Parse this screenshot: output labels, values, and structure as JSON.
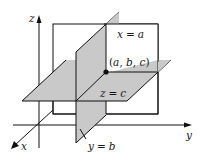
{
  "diagram": {
    "colors": {
      "plane_fill": "#c9c9c9",
      "line": "#111111",
      "background": "#ffffff"
    },
    "axes": {
      "x": {
        "label": "x"
      },
      "y": {
        "label": "y"
      },
      "z": {
        "label": "z"
      }
    },
    "planes": [
      {
        "id": "plane-x",
        "label_var": "x",
        "label_eq": "=",
        "label_const": "a"
      },
      {
        "id": "plane-y",
        "label_var": "y",
        "label_eq": "=",
        "label_const": "b"
      },
      {
        "id": "plane-z",
        "label_var": "z",
        "label_eq": "=",
        "label_const": "c"
      }
    ],
    "point": {
      "label": "(a, b, c)",
      "open": "(",
      "a": "a",
      "sep1": ", ",
      "b": "b",
      "sep2": ", ",
      "c": "c",
      "close": ")"
    }
  }
}
